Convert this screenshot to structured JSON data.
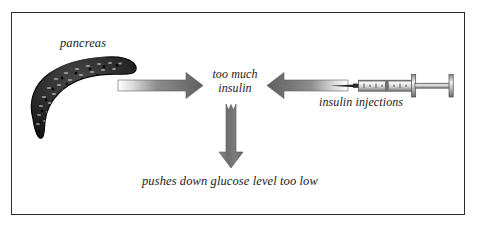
{
  "figure": {
    "type": "flow-diagram",
    "title_text": "",
    "border_color": "#2b2b2b",
    "background_color": "#ffffff",
    "arrow_color": "#6a6a6a",
    "organ_color": "#1c1c1c"
  },
  "labels": {
    "pancreas": "pancreas",
    "center": "too much insulin",
    "center_line1": "too much",
    "center_line2": "insulin",
    "injections": "insulin injections",
    "outcome": "pushes down glucose level too low"
  },
  "icons": {
    "pancreas": "pancreas-organ-icon",
    "syringe": "syringe-icon",
    "arrow_right": "arrow-right-icon",
    "arrow_left": "arrow-left-icon",
    "arrow_down": "arrow-down-icon"
  },
  "flow": {
    "nodes": [
      {
        "id": "pancreas",
        "label": "pancreas",
        "kind": "organ"
      },
      {
        "id": "too-much-insulin",
        "label": "too much insulin",
        "kind": "state"
      },
      {
        "id": "insulin-injections",
        "label": "insulin injections",
        "kind": "source"
      },
      {
        "id": "outcome",
        "label": "pushes down glucose level too low",
        "kind": "outcome"
      }
    ],
    "edges": [
      {
        "from": "pancreas",
        "to": "too-much-insulin",
        "direction": "right"
      },
      {
        "from": "insulin-injections",
        "to": "too-much-insulin",
        "direction": "left"
      },
      {
        "from": "too-much-insulin",
        "to": "outcome",
        "direction": "down"
      }
    ]
  }
}
